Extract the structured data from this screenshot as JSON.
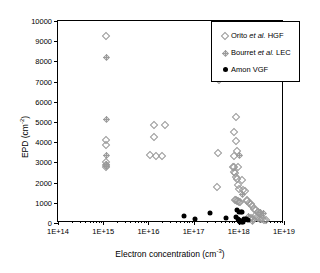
{
  "chart_data": {
    "type": "scatter",
    "title": "",
    "xlabel": "Electron concentration (cm-3)",
    "xlabel_base": "Electron concentration (cm",
    "xlabel_exp": "-3",
    "xlabel_tail": ")",
    "ylabel": "EPD (cm-2)",
    "ylabel_base": "EPD (cm",
    "ylabel_exp": "-2",
    "ylabel_tail": ")",
    "xscale": "log",
    "yscale": "linear",
    "xlim": [
      100000000000000.0,
      1e+19
    ],
    "ylim": [
      0,
      10000
    ],
    "grid": false,
    "legend_position": "top-right",
    "xticks": [
      "1E+14",
      "1E+15",
      "1E+16",
      "1E+17",
      "1E+18",
      "1E+19"
    ],
    "xtick_values": [
      100000000000000.0,
      1000000000000000.0,
      1e+16,
      1e+17,
      1e+18,
      1e+19
    ],
    "yticks": [
      "0",
      "1000",
      "2000",
      "3000",
      "4000",
      "5000",
      "6000",
      "7000",
      "8000",
      "9000",
      "10000"
    ],
    "ytick_values": [
      0,
      1000,
      2000,
      3000,
      4000,
      5000,
      6000,
      7000,
      8000,
      9000,
      10000
    ],
    "series": [
      {
        "name": "Orito et al. HGF",
        "marker": "open-diamond",
        "color": "#9a9a9a",
        "points": [
          [
            1150000000000000.0,
            9250
          ],
          [
            1180000000000000.0,
            4130
          ],
          [
            1150000000000000.0,
            3870
          ],
          [
            1150000000000000.0,
            3000
          ],
          [
            1130000000000000.0,
            2880
          ],
          [
            1170000000000000.0,
            2780
          ],
          [
            1.3e+16,
            4850
          ],
          [
            2.3e+16,
            4850
          ],
          [
            1.35e+16,
            4250
          ],
          [
            1.1e+16,
            3350
          ],
          [
            1.5e+16,
            3340
          ],
          [
            2e+16,
            3340
          ],
          [
            3.6e+17,
            7060
          ],
          [
            3.4e+17,
            3450
          ],
          [
            3.3e+17,
            1760
          ],
          [
            8.5e+17,
            5250
          ],
          [
            8e+17,
            4520
          ],
          [
            8.6e+17,
            4080
          ],
          [
            9e+17,
            3580
          ],
          [
            8e+17,
            3340
          ],
          [
            7.6e+17,
            2780
          ],
          [
            8e+17,
            2760
          ],
          [
            9.5e+17,
            2750
          ],
          [
            7.8e+17,
            2520
          ],
          [
            8.2e+17,
            2480
          ],
          [
            8.6e+17,
            2260
          ],
          [
            9e+17,
            2200
          ],
          [
            1.2e+18,
            2150
          ],
          [
            9.4e+17,
            1880
          ],
          [
            1e+18,
            1700
          ],
          [
            1.25e+18,
            1620
          ],
          [
            1.4e+18,
            1560
          ],
          [
            8.4e+17,
            1150
          ],
          [
            8.8e+17,
            1120
          ],
          [
            9.2e+17,
            1100
          ],
          [
            9.6e+17,
            1080
          ],
          [
            1e+18,
            1060
          ],
          [
            1.05e+18,
            1040
          ],
          [
            1.5e+18,
            1150
          ],
          [
            1.55e+18,
            1080
          ],
          [
            1.7e+18,
            980
          ],
          [
            1.85e+18,
            930
          ],
          [
            2e+18,
            860
          ],
          [
            2.2e+18,
            700
          ],
          [
            2.4e+18,
            620
          ],
          [
            2.6e+18,
            560
          ],
          [
            2.8e+18,
            500
          ],
          [
            3e+18,
            430
          ],
          [
            2.3e+18,
            330
          ],
          [
            2.5e+18,
            290
          ],
          [
            2.7e+18,
            250
          ],
          [
            3e+18,
            210
          ],
          [
            3.3e+18,
            190
          ],
          [
            3.6e+18,
            160
          ],
          [
            3.9e+18,
            140
          ],
          [
            1.9e+18,
            240
          ],
          [
            2.05e+18,
            200
          ],
          [
            1.75e+18,
            180
          ]
        ]
      },
      {
        "name": "Bourret et al. LEC",
        "marker": "plus-diamond",
        "color": "#9a9a9a",
        "points": [
          [
            1150000000000000.0,
            8200
          ],
          [
            1150000000000000.0,
            5150
          ],
          [
            1150000000000000.0,
            3380
          ],
          [
            1150000000000000.0,
            2900
          ],
          [
            1150000000000000.0,
            2820
          ],
          [
            3.7e+17,
            7900
          ],
          [
            1e+18,
            3380
          ],
          [
            1.15e+18,
            1450
          ],
          [
            2.9e+18,
            560
          ],
          [
            3.4e+18,
            500
          ],
          [
            1.6e+18,
            330
          ],
          [
            2e+18,
            120
          ]
        ]
      },
      {
        "name": "Amon VGF",
        "marker": "filled-circle",
        "color": "#000000",
        "points": [
          [
            6.2e+16,
            340
          ],
          [
            1.1e+17,
            180
          ],
          [
            2.3e+17,
            490
          ],
          [
            5.2e+17,
            260
          ],
          [
            8.5e+17,
            300
          ],
          [
            9e+17,
            660
          ],
          [
            1e+18,
            560
          ],
          [
            1.1e+18,
            520
          ],
          [
            1.15e+18,
            540
          ],
          [
            9.5e+17,
            180
          ],
          [
            1e+18,
            140
          ],
          [
            1.05e+18,
            120
          ],
          [
            1.2e+18,
            100
          ],
          [
            1.3e+18,
            180
          ],
          [
            1.45e+18,
            200
          ],
          [
            1.6e+18,
            170
          ],
          [
            1.05e+18,
            60
          ],
          [
            1.15e+18,
            50
          ],
          [
            1.25e+18,
            40
          ]
        ]
      }
    ]
  },
  "legend": {
    "items": [
      {
        "symbol": "open-diamond",
        "label_pre": "Orito ",
        "label_italic": "et al.",
        "label_post": " HGF"
      },
      {
        "symbol": "plus-diamond",
        "label_pre": "Bourret ",
        "label_italic": "et al.",
        "label_post": " LEC"
      },
      {
        "symbol": "filled-circle",
        "label_pre": "Amon VGF",
        "label_italic": "",
        "label_post": ""
      }
    ]
  }
}
